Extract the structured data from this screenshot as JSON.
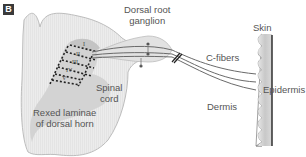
{
  "panel": {
    "label": "B"
  },
  "labels": {
    "dorsal_root_ganglion_line1": "Dorsal root",
    "dorsal_root_ganglion_line2": "ganglion",
    "skin": "Skin",
    "c_fibers": "C-fibers",
    "spinal_cord_line1": "Spinal",
    "spinal_cord_line2": "cord",
    "rexed_laminae_line1": "Rexed laminae",
    "rexed_laminae_line2": "of dorsal horn",
    "dermis": "Dermis",
    "epidermis": "Epidermis"
  },
  "laminae_numerals": [
    "I",
    "II",
    "III",
    "IV",
    "V"
  ],
  "colors": {
    "cord_fill": "#ececec",
    "cord_outline": "#b8b8b8",
    "gray_matter": "#cfcfcf",
    "laminae_dash": "#222222",
    "nerve": "#666666",
    "skin_fill": "#d4d4d4",
    "epidermis_line": "#222222"
  }
}
